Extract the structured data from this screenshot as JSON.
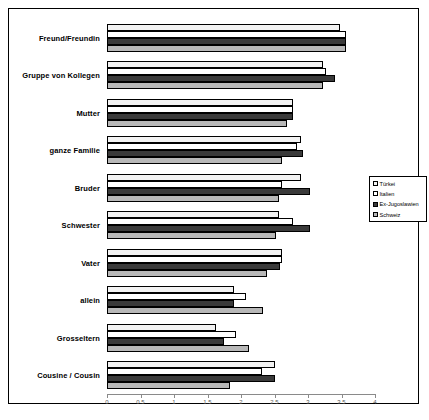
{
  "chart_data": {
    "type": "bar",
    "orientation": "horizontal",
    "title": "",
    "xlabel": "",
    "ylabel": "",
    "xlim": [
      0,
      4
    ],
    "xticks": [
      0,
      0.5,
      1,
      1.5,
      2,
      2.5,
      3,
      3.5,
      4
    ],
    "xtick_labels": [
      "0",
      "0.5",
      "1",
      "1.5",
      "2",
      "2.5",
      "3",
      "3.5",
      "4"
    ],
    "grid": false,
    "legend_position": "right-middle",
    "categories": [
      "Freund/Freundin",
      "Gruppe von Kollegen",
      "Mutter",
      "ganze Familie",
      "Bruder",
      "Schwester",
      "Vater",
      "allein",
      "Grosseltern",
      "Cousine / Cousin"
    ],
    "series": [
      {
        "name": "Türkei",
        "color": "#f2f2f2",
        "values": [
          3.48,
          3.23,
          2.78,
          2.89,
          2.89,
          2.57,
          2.61,
          1.9,
          1.62,
          2.5
        ]
      },
      {
        "name": "Italien",
        "color": "#ffffff",
        "values": [
          3.57,
          3.27,
          2.78,
          2.84,
          2.61,
          2.78,
          2.61,
          2.08,
          1.93,
          2.32
        ]
      },
      {
        "name": "Ex-Jugoslawien",
        "color": "#3a3a3a",
        "values": [
          3.57,
          3.4,
          2.78,
          2.92,
          3.03,
          3.03,
          2.58,
          1.9,
          1.75,
          2.5
        ]
      },
      {
        "name": "Schweiz",
        "color": "#b8b8b8",
        "values": [
          3.57,
          3.23,
          2.69,
          2.61,
          2.57,
          2.52,
          2.39,
          2.33,
          2.12,
          1.84
        ]
      }
    ]
  },
  "legend": {
    "items": [
      {
        "label": "Türkei",
        "swatch": "#f2f2f2"
      },
      {
        "label": "Italien",
        "swatch": "#ffffff"
      },
      {
        "label": "Ex-Jugoslawien",
        "swatch": "#3a3a3a"
      },
      {
        "label": "Schweiz",
        "swatch": "#b8b8b8"
      }
    ]
  }
}
